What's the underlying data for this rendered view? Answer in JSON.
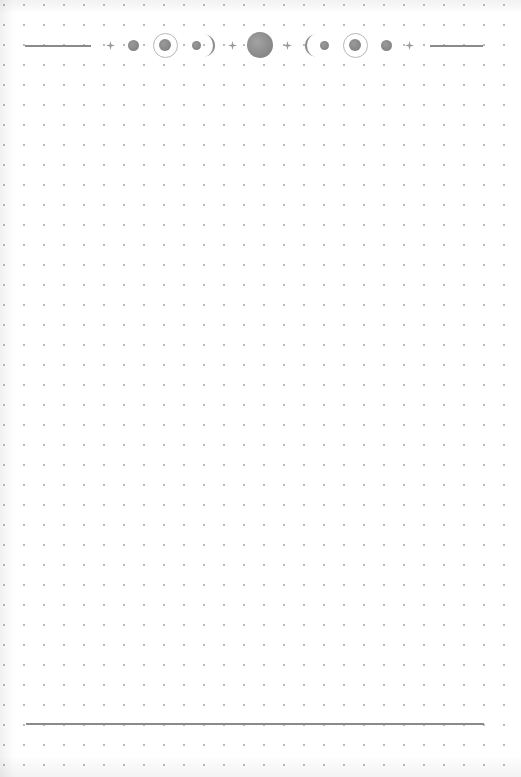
{
  "page": {
    "type": "dot-grid notebook page",
    "dot_spacing_px": 20,
    "colors": {
      "paper": "#ffffff",
      "dots": "#bdbdbd",
      "rules": "#8a8a8a",
      "moons": "#888888"
    }
  },
  "header": {
    "decoration": "moon-phase border",
    "elements": [
      "line",
      "sparkle",
      "new-moon-dot",
      "ringed-moon",
      "dot-with-waning-crescent",
      "sparkle",
      "full-moon",
      "sparkle",
      "waxing-crescent-with-dot",
      "ringed-moon",
      "new-moon-dot",
      "sparkle",
      "line"
    ]
  },
  "footer": {
    "decoration": "horizontal rule"
  }
}
